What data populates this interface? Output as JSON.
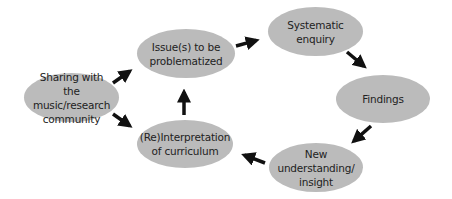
{
  "diagram": {
    "type": "cycle-flow",
    "node_fill": "#bbbbbb",
    "text_color": "#222222",
    "arrow_color": "#111111",
    "nodes": [
      {
        "id": "sharing",
        "label": "Sharing with the music/research community",
        "lines": [
          "Sharing with",
          "the music/research",
          "community"
        ],
        "x": 24,
        "y": 73,
        "w": 95,
        "h": 49
      },
      {
        "id": "issues",
        "label": "Issue(s) to be problematized",
        "lines": [
          "Issue(s) to be",
          "problematized"
        ],
        "x": 137,
        "y": 29,
        "w": 98,
        "h": 49
      },
      {
        "id": "systematic",
        "label": "Systematic enquiry",
        "lines": [
          "Systematic",
          "enquiry"
        ],
        "x": 268,
        "y": 7,
        "w": 95,
        "h": 49
      },
      {
        "id": "findings",
        "label": "Findings",
        "lines": [
          "Findings"
        ],
        "x": 336,
        "y": 75,
        "w": 94,
        "h": 48
      },
      {
        "id": "new",
        "label": "New understanding/ insight",
        "lines": [
          "New",
          "understanding/",
          "insight"
        ],
        "x": 269,
        "y": 143,
        "w": 94,
        "h": 49
      },
      {
        "id": "reinterp",
        "label": "(Re)Interpretation of curriculum",
        "lines": [
          "(Re)Interpretation",
          "of curriculum"
        ],
        "x": 137,
        "y": 120,
        "w": 96,
        "h": 48
      }
    ],
    "edges": [
      {
        "from": "sharing",
        "to": "issues",
        "x1": 113,
        "y1": 83,
        "x2": 137,
        "y2": 66
      },
      {
        "from": "sharing",
        "to": "reinterp",
        "x1": 113,
        "y1": 114,
        "x2": 137,
        "y2": 131
      },
      {
        "from": "reinterp",
        "to": "issues",
        "x1": 184,
        "y1": 115,
        "x2": 184,
        "y2": 83
      },
      {
        "from": "issues",
        "to": "systematic",
        "x1": 236,
        "y1": 46,
        "x2": 265,
        "y2": 38
      },
      {
        "from": "systematic",
        "to": "findings",
        "x1": 347,
        "y1": 52,
        "x2": 371,
        "y2": 72
      },
      {
        "from": "findings",
        "to": "new",
        "x1": 371,
        "y1": 126,
        "x2": 347,
        "y2": 147
      },
      {
        "from": "new",
        "to": "reinterp",
        "x1": 265,
        "y1": 163,
        "x2": 236,
        "y2": 152
      }
    ]
  }
}
